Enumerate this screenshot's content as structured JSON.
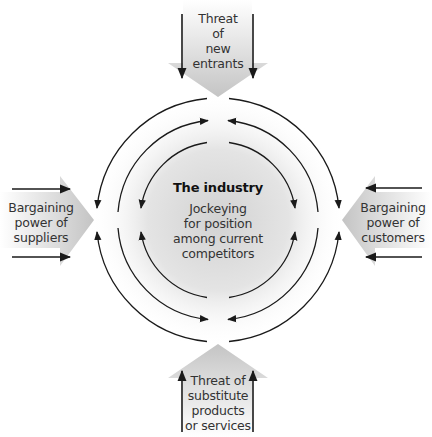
{
  "diagram": {
    "type": "five-forces",
    "center": {
      "title": "The industry",
      "lines": [
        "Jockeying",
        "for position",
        "among current",
        "competitors"
      ]
    },
    "forces": {
      "top": {
        "lines": [
          "Threat",
          "of",
          "new",
          "entrants"
        ],
        "direction": "down"
      },
      "left": {
        "lines": [
          "Bargaining",
          "power of",
          "suppliers"
        ],
        "direction": "right"
      },
      "right": {
        "lines": [
          "Bargaining",
          "power of",
          "customers"
        ],
        "direction": "left"
      },
      "bottom": {
        "lines": [
          "Threat of",
          "substitute",
          "products",
          "or services"
        ],
        "direction": "up"
      }
    },
    "rings": {
      "count": 3,
      "outer_direction": "clockwise-from-top-to-sides",
      "middle_direction": "toward-top-and-bottom",
      "inner_direction": "toward-sides"
    },
    "colors": {
      "arrow_fill": "#c8c8c8",
      "arrow_fill_light": "#e6e6e6",
      "center_shade": "#d4d4d4",
      "line": "#1a1a1a",
      "text": "#333333"
    }
  }
}
